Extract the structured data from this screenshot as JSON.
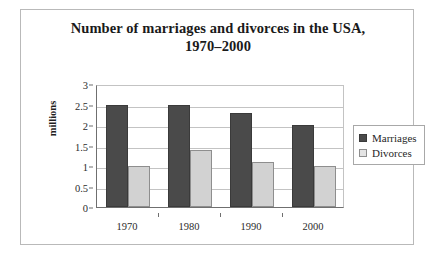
{
  "chart_data": {
    "type": "bar",
    "title": "Number of marriages and divorces in the USA, 1970–2000",
    "title_lines": [
      "Number of marriages and divorces in the USA,",
      "1970–2000"
    ],
    "categories": [
      "1970",
      "1980",
      "1990",
      "2000"
    ],
    "series": [
      {
        "name": "Marriages",
        "values": [
          2.5,
          2.5,
          2.3,
          2.0
        ],
        "color": "#4a4a4a"
      },
      {
        "name": "Divorces",
        "values": [
          1.0,
          1.4,
          1.1,
          1.0
        ],
        "color": "#d2d2d2"
      }
    ],
    "xlabel": "",
    "ylabel": "millions",
    "ylim": [
      0,
      3
    ],
    "ytick_values": [
      0,
      0.5,
      1,
      1.5,
      2,
      2.5,
      3
    ],
    "ytick_labels": [
      "0",
      "0.5",
      "1",
      "1.5",
      "2",
      "2.5",
      "3"
    ],
    "grid": true,
    "legend_position": "right"
  },
  "legend": {
    "items": [
      {
        "label": "Marriages"
      },
      {
        "label": "Divorces"
      }
    ]
  }
}
